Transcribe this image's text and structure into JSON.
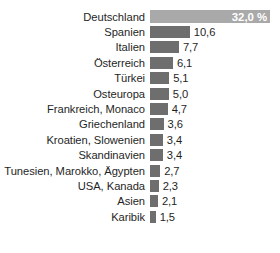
{
  "chart_data": {
    "type": "bar",
    "orientation": "horizontal",
    "title": "",
    "subtitle": "",
    "xlabel": "",
    "ylabel": "",
    "unit": "%",
    "grid": false,
    "legend": null,
    "axis_visible": false,
    "xlim": [
      0,
      32.0
    ],
    "value_format": "de-DE decimal comma",
    "categories": [
      "Deutschland",
      "Spanien",
      "Italien",
      "Österreich",
      "Türkei",
      "Osteuropa",
      "Frankreich, Monaco",
      "Griechenland",
      "Kroatien, Slowenien",
      "Skandinavien",
      "Tunesien, Marokko, Ägypten",
      "USA, Kanada",
      "Asien",
      "Karibik"
    ],
    "values": [
      32.0,
      10.6,
      7.7,
      6.1,
      5.1,
      5.0,
      4.7,
      3.6,
      3.4,
      3.4,
      2.7,
      2.3,
      2.1,
      1.5
    ],
    "value_labels": [
      "32,0 %",
      "10,6",
      "7,7",
      "6,1",
      "5,1",
      "5,0",
      "4,7",
      "3,6",
      "3,4",
      "3,4",
      "2,7",
      "2,3",
      "2,1",
      "1,5"
    ],
    "colors": {
      "bar": "#6e6e6e",
      "bar_highlight": "#a9a9a9",
      "label_text": "#1f1f1f",
      "inline_value_text": "#ffffff",
      "background": "#ffffff"
    },
    "highlight_index": 0
  },
  "rows": [
    {
      "label": "Deutschland",
      "value": 32.0,
      "value_label": "32,0 %",
      "highlight": true
    },
    {
      "label": "Spanien",
      "value": 10.6,
      "value_label": "10,6",
      "highlight": false
    },
    {
      "label": "Italien",
      "value": 7.7,
      "value_label": "7,7",
      "highlight": false
    },
    {
      "label": "Österreich",
      "value": 6.1,
      "value_label": "6,1",
      "highlight": false
    },
    {
      "label": "Türkei",
      "value": 5.1,
      "value_label": "5,1",
      "highlight": false
    },
    {
      "label": "Osteuropa",
      "value": 5.0,
      "value_label": "5,0",
      "highlight": false
    },
    {
      "label": "Frankreich, Monaco",
      "value": 4.7,
      "value_label": "4,7",
      "highlight": false
    },
    {
      "label": "Griechenland",
      "value": 3.6,
      "value_label": "3,6",
      "highlight": false
    },
    {
      "label": "Kroatien, Slowenien",
      "value": 3.4,
      "value_label": "3,4",
      "highlight": false
    },
    {
      "label": "Skandinavien",
      "value": 3.4,
      "value_label": "3,4",
      "highlight": false
    },
    {
      "label": "Tunesien, Marokko, Ägypten",
      "value": 2.7,
      "value_label": "2,7",
      "highlight": false
    },
    {
      "label": "USA, Kanada",
      "value": 2.3,
      "value_label": "2,3",
      "highlight": false
    },
    {
      "label": "Asien",
      "value": 2.1,
      "value_label": "2,1",
      "highlight": false
    },
    {
      "label": "Karibik",
      "value": 1.5,
      "value_label": "1,5",
      "highlight": false
    }
  ],
  "layout": {
    "bar_origin_px": 150,
    "max_bar_px": 120,
    "max_value": 32.0
  }
}
